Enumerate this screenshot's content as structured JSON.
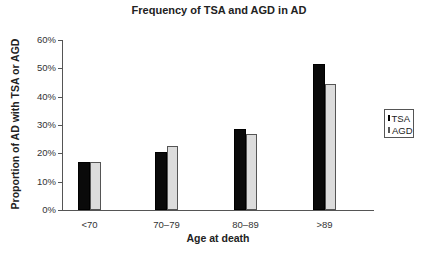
{
  "chart_data": {
    "type": "bar",
    "title": "Frequency of TSA and AGD in AD",
    "xlabel": "Age at death",
    "ylabel": "Proportion of AD with TSA or AGD",
    "categories": [
      "<70",
      "70–79",
      "80–89",
      ">89"
    ],
    "series": [
      {
        "name": "TSA",
        "color": "#0a0a0a",
        "values": [
          17,
          20.5,
          28.5,
          51.5
        ]
      },
      {
        "name": "AGD",
        "color": "#dcdcdc",
        "values": [
          17,
          22.5,
          27,
          44.5
        ]
      }
    ],
    "ylim": [
      0,
      60
    ],
    "yticks": [
      "0%",
      "10%",
      "20%",
      "30%",
      "40%",
      "50%",
      "60%"
    ],
    "grid": false,
    "legend_position": "right"
  }
}
